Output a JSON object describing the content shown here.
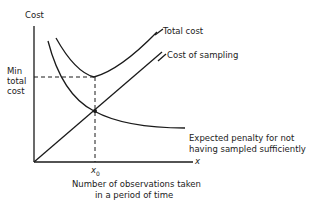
{
  "diagram": {
    "y_axis_label": "Cost",
    "x_axis_symbol": "x",
    "x0_label": "x",
    "x0_sub": "0",
    "min_label": [
      "Min",
      "total",
      "cost"
    ],
    "curves": {
      "total_cost": "Total cost",
      "sampling": "Cost of sampling",
      "penalty": [
        "Expected penalty for not",
        "having sampled sufficiently"
      ]
    },
    "x_axis_caption": [
      "Number of observations taken",
      "in a period of time"
    ]
  }
}
